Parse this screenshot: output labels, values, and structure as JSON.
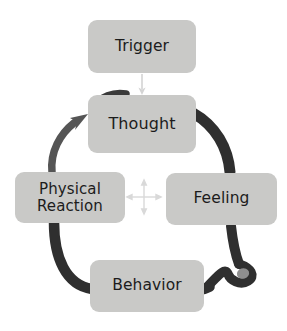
{
  "diagram": {
    "type": "cycle",
    "background_color": "#ffffff",
    "node_fill_color": "#c9c9c7",
    "node_text_color": "#1c1c1c",
    "dark_arrow_color": "#2f2f2f",
    "mid_arrow_color": "#555555",
    "light_arrow_color": "#d4d4d4",
    "nodes": [
      {
        "id": "trigger",
        "label": "Trigger",
        "icon": "rounded-rect-node"
      },
      {
        "id": "thought",
        "label": "Thought",
        "icon": "rounded-rect-node"
      },
      {
        "id": "feeling",
        "label": "Feeling",
        "icon": "rounded-rect-node"
      },
      {
        "id": "behavior",
        "label": "Behavior",
        "icon": "rounded-rect-node"
      },
      {
        "id": "physical_reaction",
        "label": "Physical\nReaction",
        "icon": "rounded-rect-node"
      }
    ],
    "connectors": [
      {
        "id": "trigger-to-thought",
        "from": "trigger",
        "to": "thought",
        "style": "thin-straight-arrow",
        "color": "#d4d4d4"
      },
      {
        "id": "thought-hook",
        "from": "thought",
        "to": "thought",
        "style": "short-curved-hook",
        "color": "#3a3a3a"
      },
      {
        "id": "thought-to-feeling",
        "from": "thought",
        "to": "feeling",
        "style": "thick-arc",
        "color": "#2f2f2f"
      },
      {
        "id": "feeling-to-behavior",
        "from": "feeling",
        "to": "behavior",
        "style": "thick-arc-with-loop",
        "color": "#2f2f2f"
      },
      {
        "id": "physical-to-behavior",
        "from": "physical_reaction",
        "to": "behavior",
        "style": "thick-arc",
        "color": "#2f2f2f"
      },
      {
        "id": "physical-to-thought",
        "from": "physical_reaction",
        "to": "thought",
        "style": "curved-arrow",
        "color": "#555555"
      }
    ],
    "center_marker": {
      "id": "center-cross",
      "icon": "four-way-arrow-icon",
      "color": "#d9d9d9",
      "description": "four-way cross arrow linking all nodes"
    }
  }
}
